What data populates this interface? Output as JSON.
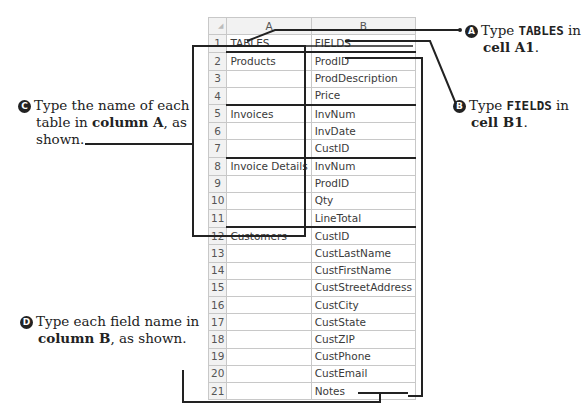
{
  "spreadsheet": {
    "corner": "◢",
    "columns": [
      "A",
      "B"
    ],
    "rows": [
      {
        "n": "1",
        "a": "TABLES",
        "b": "FIELDS"
      },
      {
        "n": "2",
        "a": "Products",
        "b": "ProdID"
      },
      {
        "n": "3",
        "a": "",
        "b": "ProdDescription"
      },
      {
        "n": "4",
        "a": "",
        "b": "Price"
      },
      {
        "n": "5",
        "a": "Invoices",
        "b": "InvNum"
      },
      {
        "n": "6",
        "a": "",
        "b": "InvDate"
      },
      {
        "n": "7",
        "a": "",
        "b": "CustID"
      },
      {
        "n": "8",
        "a": "Invoice Details",
        "b": "InvNum"
      },
      {
        "n": "9",
        "a": "",
        "b": "ProdID"
      },
      {
        "n": "10",
        "a": "",
        "b": "Qty"
      },
      {
        "n": "11",
        "a": "",
        "b": "LineTotal"
      },
      {
        "n": "12",
        "a": "Customers",
        "b": "CustID"
      },
      {
        "n": "13",
        "a": "",
        "b": "CustLastName"
      },
      {
        "n": "14",
        "a": "",
        "b": "CustFirstName"
      },
      {
        "n": "15",
        "a": "",
        "b": "CustStreetAddress"
      },
      {
        "n": "16",
        "a": "",
        "b": "CustCity"
      },
      {
        "n": "17",
        "a": "",
        "b": "CustState"
      },
      {
        "n": "18",
        "a": "",
        "b": "CustZIP"
      },
      {
        "n": "19",
        "a": "",
        "b": "CustPhone"
      },
      {
        "n": "20",
        "a": "",
        "b": "CustEmail"
      },
      {
        "n": "21",
        "a": "",
        "b": "Notes"
      }
    ]
  },
  "callouts": {
    "a": {
      "badge": "A",
      "pre": "Type ",
      "code": "TABLES",
      "mid": " in",
      "cell": "cell A1",
      "end": "."
    },
    "b": {
      "badge": "B",
      "pre": "Type ",
      "code": "FIELDS",
      "mid": " in",
      "cell": "cell B1",
      "end": "."
    },
    "c": {
      "badge": "C",
      "line1": "Type the name of each",
      "pre2": "table in ",
      "bold": "column A",
      "post2": ", as",
      "line3": "shown."
    },
    "d": {
      "badge": "D",
      "line1": "Type each field name in",
      "bold": "column B",
      "post2": ", as shown."
    }
  },
  "colors": {
    "line": "#222222",
    "grid": "#c8c8c8",
    "header_bg": "#f2f2f2"
  }
}
